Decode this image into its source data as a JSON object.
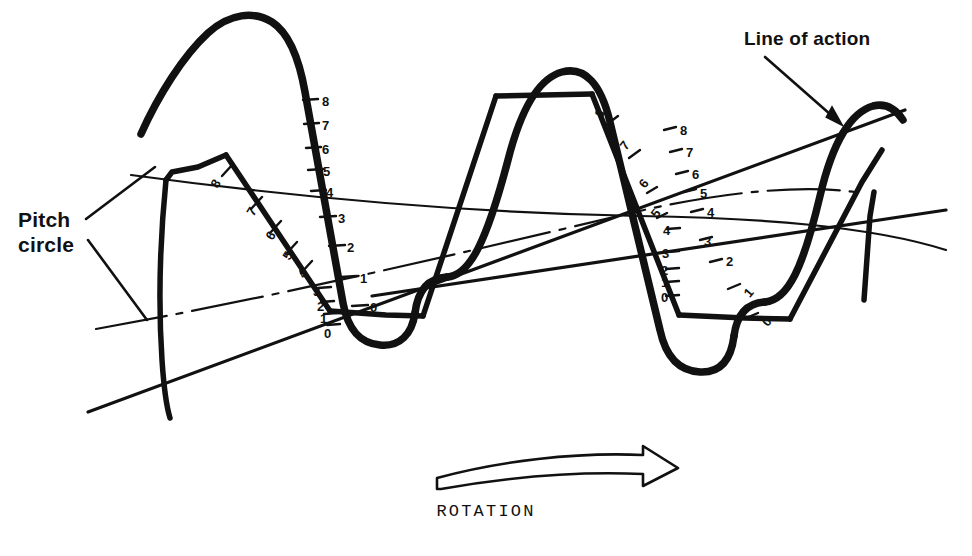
{
  "figure": {
    "kind": "gear-tooth-conjugate-action-diagram",
    "background": "#ffffff",
    "ink": "#111111",
    "width": 972,
    "height": 556
  },
  "labels": {
    "pitch_circle": "Pitch\ncircle",
    "pitch_circle_line1": "Pitch",
    "pitch_circle_line2": "circle",
    "line_of_action": "Line of action",
    "rotation": "ROTATION"
  },
  "icons": {
    "rotation_arrow": "curved-right-arrow-icon",
    "pitch_circle_leader": "leader-line-icon",
    "line_of_action_leader": "arrow-leader-icon"
  },
  "chart_data": {
    "type": "diagram",
    "annotations": [
      "Pitch circle",
      "Line of action",
      "ROTATION"
    ],
    "scales": [
      {
        "name": "driver-tooth-flank-scale-left",
        "tick_labels": [
          "0",
          "1",
          "2",
          "3",
          "4",
          "5",
          "6",
          "7",
          "8"
        ],
        "orientation": "along-inclined-tooth-flank",
        "direction": "0 at bottom to 8 at top"
      },
      {
        "name": "driven-tooth-flank-scale-left",
        "tick_labels": [
          "0",
          "1",
          "2",
          "3",
          "4",
          "5",
          "6",
          "7",
          "8"
        ],
        "orientation": "along-vertical-tooth-flank",
        "direction": "0 at bottom to 8 at top"
      },
      {
        "name": "driver-tooth-flank-scale-right",
        "tick_labels": [
          "0",
          "1",
          "2",
          "3",
          "4",
          "5",
          "6",
          "7",
          "8"
        ],
        "orientation": "along-inclined-tooth-flank",
        "direction": "0 at bottom to 8 at top"
      },
      {
        "name": "driven-tooth-flank-scale-right",
        "tick_labels": [
          "0",
          "1",
          "2",
          "3",
          "4",
          "5",
          "6",
          "7",
          "8"
        ],
        "orientation": "along-inclined-tooth-flank",
        "direction": "0 at bottom to 8 at top"
      }
    ]
  },
  "scale_ticks": {
    "left_vertical": [
      {
        "label": "8",
        "x": 322,
        "y": 94,
        "rot": 0
      },
      {
        "label": "7",
        "x": 322,
        "y": 118,
        "rot": 0
      },
      {
        "label": "6",
        "x": 322,
        "y": 142,
        "rot": 0
      },
      {
        "label": "5",
        "x": 323,
        "y": 164,
        "rot": 0
      },
      {
        "label": "4",
        "x": 326,
        "y": 185,
        "rot": 0
      },
      {
        "label": "3",
        "x": 338,
        "y": 211,
        "rot": 0
      },
      {
        "label": "2",
        "x": 347,
        "y": 240,
        "rot": 0
      },
      {
        "label": "1",
        "x": 360,
        "y": 271,
        "rot": 0
      },
      {
        "label": "0",
        "x": 370,
        "y": 300,
        "rot": 0
      }
    ],
    "left_inclined": [
      {
        "label": "8",
        "x": 212,
        "y": 176,
        "rot": -58
      },
      {
        "label": "7",
        "x": 248,
        "y": 204,
        "rot": -58
      },
      {
        "label": "6",
        "x": 267,
        "y": 228,
        "rot": -58
      },
      {
        "label": "5",
        "x": 284,
        "y": 248,
        "rot": -58
      },
      {
        "label": "4",
        "x": 299,
        "y": 266,
        "rot": -58
      },
      {
        "label": "3",
        "x": 313,
        "y": 284,
        "rot": 0
      },
      {
        "label": "2",
        "x": 317,
        "y": 299,
        "rot": 0
      },
      {
        "label": "1",
        "x": 320,
        "y": 311,
        "rot": 0
      },
      {
        "label": "0",
        "x": 324,
        "y": 326,
        "rot": 0
      }
    ],
    "right_inclined_outer": [
      {
        "label": "8",
        "x": 596,
        "y": 106,
        "rot": -52
      },
      {
        "label": "7",
        "x": 621,
        "y": 138,
        "rot": -52
      },
      {
        "label": "6",
        "x": 640,
        "y": 176,
        "rot": -52
      },
      {
        "label": "5",
        "x": 652,
        "y": 206,
        "rot": -52
      },
      {
        "label": "4",
        "x": 663,
        "y": 223,
        "rot": 0
      },
      {
        "label": "3",
        "x": 662,
        "y": 246,
        "rot": 0
      },
      {
        "label": "2",
        "x": 661,
        "y": 263,
        "rot": 0
      },
      {
        "label": "1",
        "x": 661,
        "y": 275,
        "rot": 0
      },
      {
        "label": "0",
        "x": 661,
        "y": 290,
        "rot": 0
      }
    ],
    "right_inclined_inner": [
      {
        "label": "8",
        "x": 680,
        "y": 123,
        "rot": 0
      },
      {
        "label": "7",
        "x": 686,
        "y": 145,
        "rot": 0
      },
      {
        "label": "6",
        "x": 692,
        "y": 167,
        "rot": 0
      },
      {
        "label": "5",
        "x": 700,
        "y": 186,
        "rot": 0
      },
      {
        "label": "4",
        "x": 707,
        "y": 205,
        "rot": 0
      },
      {
        "label": "3",
        "x": 704,
        "y": 234,
        "rot": 0
      },
      {
        "label": "2",
        "x": 726,
        "y": 254,
        "rot": 0
      },
      {
        "label": "1",
        "x": 745,
        "y": 285,
        "rot": -50
      },
      {
        "label": "0",
        "x": 763,
        "y": 314,
        "rot": -50
      }
    ]
  }
}
